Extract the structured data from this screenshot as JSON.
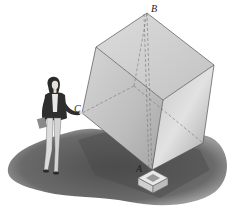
{
  "figure": {
    "labels": {
      "A": "A",
      "B": "B",
      "C": "C"
    },
    "colors": {
      "background": "#ffffff",
      "shadow": "#6a6a6a",
      "cube_left_face": "#b8b8b8",
      "cube_right_face": "#a8a8a8",
      "cube_top_face": "#cfcfcf",
      "edge": "#555555",
      "hidden_edge": "#777777"
    }
  }
}
